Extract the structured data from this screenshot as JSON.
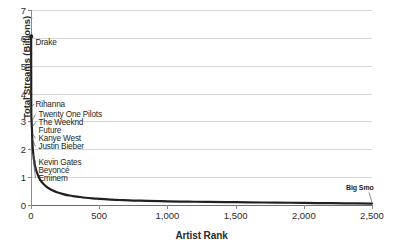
{
  "chart_data": {
    "type": "line",
    "title": "",
    "xlabel": "Artist Rank",
    "ylabel": "Total Streams (Billions)",
    "xlim": [
      0,
      2500
    ],
    "ylim": [
      0,
      7
    ],
    "grid": true,
    "legend": "none",
    "xticks": [
      "0",
      "500",
      "1,000",
      "1,500",
      "2,000",
      "2,500"
    ],
    "xtick_values": [
      0,
      500,
      1000,
      1500,
      2000,
      2500
    ],
    "yticks": [
      "0",
      "1",
      "2",
      "3",
      "4",
      "5",
      "6",
      "7"
    ],
    "ytick_values": [
      0,
      1,
      2,
      3,
      4,
      5,
      6,
      7
    ],
    "series": [
      {
        "name": "Total streams by artist rank",
        "x": [
          1,
          2,
          3,
          4,
          5,
          6,
          7,
          8,
          9,
          10,
          12,
          15,
          18,
          22,
          26,
          30,
          35,
          40,
          50,
          60,
          75,
          90,
          110,
          130,
          160,
          190,
          230,
          280,
          340,
          400,
          480,
          560,
          650,
          750,
          850,
          1000,
          1150,
          1300,
          1500,
          1700,
          1900,
          2100,
          2300,
          2500
        ],
        "y": [
          6.05,
          3.55,
          3.15,
          3.02,
          2.92,
          2.82,
          2.72,
          2.58,
          2.42,
          2.3,
          2.1,
          1.92,
          1.78,
          1.62,
          1.5,
          1.4,
          1.3,
          1.22,
          1.08,
          0.97,
          0.85,
          0.76,
          0.67,
          0.6,
          0.52,
          0.46,
          0.4,
          0.34,
          0.3,
          0.26,
          0.23,
          0.2,
          0.18,
          0.16,
          0.15,
          0.13,
          0.12,
          0.11,
          0.1,
          0.09,
          0.08,
          0.07,
          0.06,
          0.05
        ]
      }
    ],
    "annotations": [
      {
        "label": "Drake",
        "rank": 1,
        "value": 6.05
      },
      {
        "label": "Rihanna",
        "rank": 2,
        "value": 3.55
      },
      {
        "label": "Twenty One Pilots",
        "rank": 3,
        "value": 3.15
      },
      {
        "label": "The Weeknd",
        "rank": 4,
        "value": 3.02
      },
      {
        "label": "Future",
        "rank": 5,
        "value": 2.92
      },
      {
        "label": "Kanye West",
        "rank": 6,
        "value": 2.72
      },
      {
        "label": "Justin Bieber",
        "rank": 7,
        "value": 2.58
      },
      {
        "label": "Kevin Gates",
        "rank": 9,
        "value": 2.1
      },
      {
        "label": "Beyoncé",
        "rank": 10,
        "value": 1.95
      },
      {
        "label": "Eminem",
        "rank": 12,
        "value": 1.8
      },
      {
        "label": "Big Smo",
        "rank": 2500,
        "value": 0.05
      }
    ]
  },
  "colors": {
    "curve": "#231f20",
    "grid": "#d8d8d8",
    "axis": "#8a8a8a",
    "text": "#1e1e1e",
    "background": "#ffffff"
  }
}
